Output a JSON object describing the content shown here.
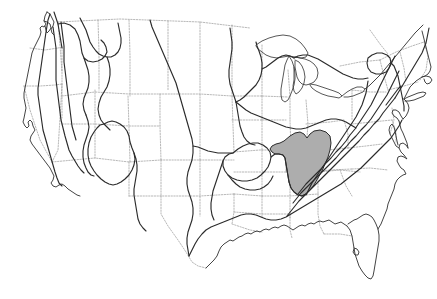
{
  "figure": {
    "type": "reference-map",
    "background_color": "#ffffff",
    "width_px": 437,
    "height_px": 299,
    "caption": "",
    "labels_visible": "none"
  },
  "legend": {
    "visible": false,
    "entries": [
      {
        "name": "province-boundary",
        "style": "solid black line",
        "color": "#2b2b2b"
      },
      {
        "name": "state-boundary",
        "style": "light gray dotted line",
        "color": "#9a9a9a"
      },
      {
        "name": "highlighted-area",
        "style": "gray fill",
        "color": "#adadad"
      }
    ]
  },
  "map": {
    "extent": "conterminous United States",
    "coastline_color": "#3a3a3a",
    "state_border_color": "#9a9a9a",
    "province_line_color": "#2b2b2b",
    "shaded_fill_color": "#adadad",
    "shaded_stroke_color": "#2b2b2b"
  },
  "highlighted_region": {
    "name": "interior-low-plateaus-nashville-dome",
    "fill_color": "#adadad",
    "approx_states": "Kentucky and Tennessee",
    "label_text": ""
  },
  "features": {
    "great_lakes": [
      "Superior",
      "Michigan",
      "Huron",
      "Erie",
      "Ontario"
    ],
    "bays": [
      "Chesapeake Bay",
      "Delaware Bay",
      "Long Island Sound"
    ],
    "peninsulas": [
      "Florida",
      "Cape Cod",
      "Upper Michigan",
      "Lower Michigan",
      "Delmarva"
    ]
  },
  "annotations": []
}
